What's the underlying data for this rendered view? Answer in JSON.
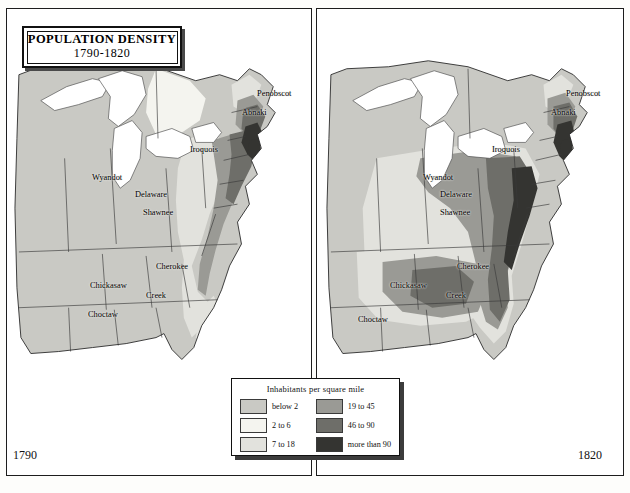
{
  "title": {
    "main": "POPULATION DENSITY",
    "sub": "1790-1820"
  },
  "legend": {
    "heading": "Inhabitants per square mile",
    "items": [
      {
        "label": "below 2",
        "color": "#c9c9c4"
      },
      {
        "label": "19 to 45",
        "color": "#9a9a95"
      },
      {
        "label": "2 to 6",
        "color": "#f4f4ef"
      },
      {
        "label": "46 to 90",
        "color": "#6e6e69"
      },
      {
        "label": "7 to 18",
        "color": "#e2e2dd"
      },
      {
        "label": "more than 90",
        "color": "#343431"
      }
    ]
  },
  "panels": [
    {
      "year": "1790",
      "tribes": [
        {
          "name": "Penobscot",
          "x": 257,
          "y": 89
        },
        {
          "name": "Abnaki",
          "x": 242,
          "y": 108
        },
        {
          "name": "Iroquois",
          "x": 190,
          "y": 145
        },
        {
          "name": "Wyandot",
          "x": 92,
          "y": 173
        },
        {
          "name": "Delaware",
          "x": 135,
          "y": 190
        },
        {
          "name": "Shawnee",
          "x": 143,
          "y": 208
        },
        {
          "name": "Cherokee",
          "x": 156,
          "y": 262
        },
        {
          "name": "Chickasaw",
          "x": 90,
          "y": 281
        },
        {
          "name": "Creek",
          "x": 146,
          "y": 291
        },
        {
          "name": "Choctaw",
          "x": 88,
          "y": 310
        }
      ]
    },
    {
      "year": "1820",
      "tribes": [
        {
          "name": "Penobscot",
          "x": 566,
          "y": 89
        },
        {
          "name": "Abnaki",
          "x": 551,
          "y": 108
        },
        {
          "name": "Iroquois",
          "x": 492,
          "y": 145
        },
        {
          "name": "Wyandot",
          "x": 423,
          "y": 173
        },
        {
          "name": "Delaware",
          "x": 440,
          "y": 190
        },
        {
          "name": "Shawnee",
          "x": 440,
          "y": 208
        },
        {
          "name": "Cherokee",
          "x": 457,
          "y": 262
        },
        {
          "name": "Chickasaw",
          "x": 390,
          "y": 281
        },
        {
          "name": "Creek",
          "x": 446,
          "y": 291
        },
        {
          "name": "Choctaw",
          "x": 358,
          "y": 315
        }
      ]
    }
  ],
  "chart_data": {
    "type": "map",
    "title": "POPULATION DENSITY 1790-1820",
    "subtitle": "Inhabitants per square mile",
    "panels": [
      {
        "year": "1790",
        "region": "Eastern United States",
        "density_classes_present": [
          "below 2",
          "2 to 6",
          "7 to 18",
          "19 to 45",
          "46 to 90",
          "more than 90"
        ],
        "notes": "Dense settlement confined to the Atlantic seaboard; interior largely below 2 inhabitants per square mile"
      },
      {
        "year": "1820",
        "region": "Eastern United States",
        "density_classes_present": [
          "below 2",
          "2 to 6",
          "7 to 18",
          "19 to 45",
          "46 to 90",
          "more than 90"
        ],
        "notes": "Settlement expanded west across the Appalachians into Ohio, Kentucky, Tennessee and the Gulf states"
      }
    ],
    "legend_bins": [
      {
        "label": "below 2",
        "min": 0,
        "max": 2,
        "color": "#c9c9c4"
      },
      {
        "label": "2 to 6",
        "min": 2,
        "max": 6,
        "color": "#f4f4ef"
      },
      {
        "label": "7 to 18",
        "min": 7,
        "max": 18,
        "color": "#e2e2dd"
      },
      {
        "label": "19 to 45",
        "min": 19,
        "max": 45,
        "color": "#9a9a95"
      },
      {
        "label": "46 to 90",
        "min": 46,
        "max": 90,
        "color": "#6e6e69"
      },
      {
        "label": "more than 90",
        "min": 90,
        "max": null,
        "color": "#343431"
      }
    ],
    "tribal_labels": [
      "Penobscot",
      "Abnaki",
      "Iroquois",
      "Wyandot",
      "Delaware",
      "Shawnee",
      "Cherokee",
      "Chickasaw",
      "Creek",
      "Choctaw"
    ]
  }
}
